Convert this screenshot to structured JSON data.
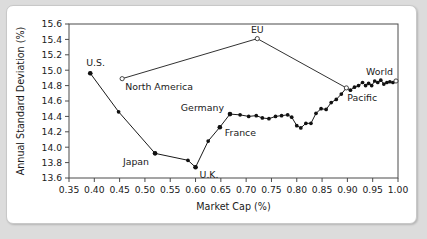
{
  "figure": {
    "background_color": "#ffffff",
    "page_background_color": "#dcdcdc",
    "line_color": "#1a1a1a"
  },
  "chart_data": {
    "type": "line",
    "title": "",
    "xlabel": "Market Cap (%)",
    "ylabel": "Annual Standard Deviation (%)",
    "xlim": [
      0.35,
      1.0
    ],
    "ylim": [
      13.6,
      15.6
    ],
    "xticks": [
      0.35,
      0.4,
      0.45,
      0.5,
      0.55,
      0.6,
      0.65,
      0.7,
      0.75,
      0.8,
      0.85,
      0.9,
      0.95,
      1.0
    ],
    "xtick_labels": [
      "0.35",
      "0.40",
      "0.45",
      "0.50",
      "0.55",
      "0.60",
      "0.65",
      "0.70",
      "0.75",
      "0.80",
      "0.85",
      "0.90",
      "0.95",
      "1.00"
    ],
    "yticks": [
      13.6,
      13.8,
      14.0,
      14.2,
      14.4,
      14.6,
      14.8,
      15.0,
      15.2,
      15.4,
      15.6
    ],
    "ytick_labels": [
      "13.6",
      "13.8",
      "14.0",
      "14.2",
      "14.4",
      "14.6",
      "14.8",
      "15.0",
      "15.2",
      "15.4",
      "15.6"
    ],
    "grid": false,
    "legend": "none",
    "x": [
      0.392,
      0.448,
      0.52,
      0.585,
      0.6,
      0.625,
      0.648,
      0.668,
      0.688,
      0.705,
      0.72,
      0.732,
      0.745,
      0.758,
      0.77,
      0.782,
      0.79,
      0.8,
      0.808,
      0.818,
      0.828,
      0.838,
      0.848,
      0.858,
      0.868,
      0.878,
      0.888,
      0.898,
      0.906,
      0.914,
      0.922,
      0.93,
      0.936,
      0.942,
      0.948,
      0.954,
      0.96,
      0.966,
      0.972,
      0.978,
      0.984,
      0.99,
      0.996
    ],
    "y": [
      14.96,
      14.46,
      13.92,
      13.83,
      13.74,
      14.08,
      14.26,
      14.43,
      14.42,
      14.4,
      14.41,
      14.38,
      14.37,
      14.4,
      14.41,
      14.42,
      14.39,
      14.28,
      14.25,
      14.31,
      14.31,
      14.44,
      14.5,
      14.49,
      14.58,
      14.62,
      14.69,
      14.77,
      14.74,
      14.78,
      14.8,
      14.84,
      14.8,
      14.83,
      14.8,
      14.86,
      14.84,
      14.87,
      14.82,
      14.84,
      14.85,
      14.84,
      14.86
    ],
    "highlight_points": [
      {
        "label": "U.S.",
        "x": 0.392,
        "y": 14.96,
        "marker": "filled",
        "label_dx": -4,
        "label_dy": -7,
        "anchor": "start"
      },
      {
        "label": "North America",
        "x": 0.455,
        "y": 14.89,
        "marker": "open",
        "label_dx": 3,
        "label_dy": 11,
        "anchor": "start"
      },
      {
        "label": "EU",
        "x": 0.722,
        "y": 15.41,
        "marker": "open",
        "label_dx": 0,
        "label_dy": -6,
        "anchor": "middle"
      },
      {
        "label": "Japan",
        "x": 0.52,
        "y": 13.92,
        "marker": "filled",
        "label_dx": -6,
        "label_dy": 12,
        "anchor": "end"
      },
      {
        "label": "U.K.",
        "x": 0.6,
        "y": 13.74,
        "marker": "filled",
        "label_dx": 4,
        "label_dy": 11,
        "anchor": "start"
      },
      {
        "label": "France",
        "x": 0.648,
        "y": 14.26,
        "marker": "filled",
        "label_dx": 5,
        "label_dy": 9,
        "anchor": "start"
      },
      {
        "label": "Germany",
        "x": 0.668,
        "y": 14.43,
        "marker": "filled",
        "label_dx": -6,
        "label_dy": -3,
        "anchor": "end"
      },
      {
        "label": "Pacific",
        "x": 0.898,
        "y": 14.77,
        "marker": "open",
        "label_dx": 1,
        "label_dy": 13,
        "anchor": "start"
      },
      {
        "label": "World",
        "x": 0.996,
        "y": 14.86,
        "marker": "open",
        "label_dx": -3,
        "label_dy": -6,
        "anchor": "end"
      }
    ],
    "connector_segments": [
      {
        "x1": 0.455,
        "y1": 14.89,
        "x2": 0.722,
        "y2": 15.41
      },
      {
        "x1": 0.722,
        "y1": 15.41,
        "x2": 0.898,
        "y2": 14.77
      }
    ]
  }
}
